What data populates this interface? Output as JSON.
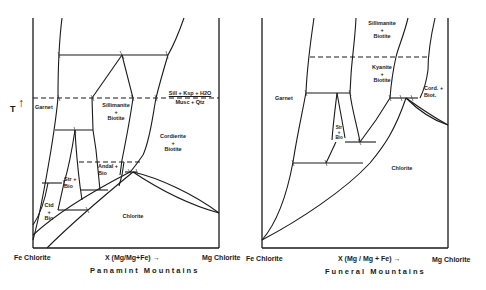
{
  "figure": {
    "y_axis_label": "T",
    "panels": [
      {
        "title": "Panamint Mountains",
        "x_left_label": "Fe Chlorite",
        "x_mid_label": "X (Mg/Mg+Fe) →",
        "x_right_label": "Mg Chlorite",
        "fields": {
          "garnet": "Garnet",
          "sill_bio": "Sillimanite\n+\nBiotite",
          "reaction": "Sill + Ksp + H2O",
          "reaction_2": "Musc + Qtz",
          "cord_bio": "Cordierite\n+\nBiotite",
          "andal_bio": "Andal +\nBio",
          "str_bio": "Str +\nBio",
          "ctd_bio": "Ctd\n+\nBio",
          "chlorite": "Chlorite"
        }
      },
      {
        "title": "Funeral Mountains",
        "x_left_label": "Fe Chlorite",
        "x_mid_label": "X (Mg / Mg + Fe) →",
        "x_right_label": "Mg Chlorite",
        "fields": {
          "sill_bio": "Sillimanite\n+\nBiotite",
          "ky_bio": "Kyanite\n+\nBiotite",
          "garnet": "Garnet",
          "cord_biot": "Cord. +\nBiot.",
          "str_bio": "Str\n+\nBio",
          "chlorite": "Chlorite"
        }
      }
    ]
  }
}
